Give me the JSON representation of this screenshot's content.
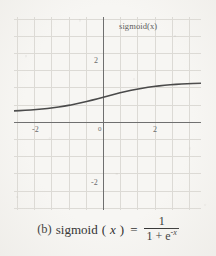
{
  "figure": {
    "axis_label": "sigmoid(x)",
    "caption": {
      "index": "(b)",
      "function_name": "sigmoid",
      "arg_open": "(",
      "variable": "x",
      "arg_close": ")",
      "equals": "=",
      "numerator": "1",
      "denominator_prefix": "1 + e",
      "denominator_exponent": "-x"
    }
  },
  "chart_data": {
    "type": "line",
    "title": "",
    "subtitle": "",
    "xlabel": "",
    "ylabel": "sigmoid(x)",
    "legend": [],
    "legend_position": "none",
    "grid": true,
    "grid_spacing": 1,
    "xlim": [
      -3.2,
      3.5
    ],
    "ylim": [
      -3.3,
      3.2
    ],
    "xticks": [
      -2,
      2
    ],
    "xtick_labels": [
      "-2",
      "2"
    ],
    "yticks": [
      2,
      -2
    ],
    "ytick_labels": [
      "2",
      "-2"
    ],
    "origin_label": "0",
    "axis_color": "#6a6a6a",
    "grid_color": "#d9d7d2",
    "curve_color": "#4a4a4a",
    "background_color": "#f7f6f3",
    "asymptotes": [
      0,
      1
    ],
    "series": [
      {
        "name": "sigmoid(x)",
        "formula": "1/(1+e^-x)",
        "x": [
          -3.2,
          -3.0,
          -2.8,
          -2.6,
          -2.4,
          -2.2,
          -2.0,
          -1.8,
          -1.6,
          -1.4,
          -1.2,
          -1.0,
          -0.8,
          -0.6,
          -0.4,
          -0.2,
          0.0,
          0.2,
          0.4,
          0.6,
          0.8,
          1.0,
          1.2,
          1.4,
          1.6,
          1.8,
          2.0,
          2.2,
          2.4,
          2.6,
          2.8,
          3.0,
          3.2,
          3.5
        ],
        "y": [
          0.039,
          0.047,
          0.057,
          0.069,
          0.083,
          0.1,
          0.119,
          0.142,
          0.168,
          0.198,
          0.231,
          0.269,
          0.31,
          0.354,
          0.401,
          0.45,
          0.5,
          0.55,
          0.599,
          0.646,
          0.69,
          0.731,
          0.769,
          0.802,
          0.832,
          0.858,
          0.881,
          0.9,
          0.917,
          0.931,
          0.943,
          0.953,
          0.961,
          0.971
        ]
      }
    ]
  },
  "ticks_px": {
    "x_neg2": {
      "label": "-2",
      "left": 32,
      "top": 126
    },
    "x_pos2": {
      "label": "2",
      "left": 153,
      "top": 126
    },
    "y_pos2": {
      "label": "2",
      "left": 94,
      "top": 57
    },
    "y_neg2": {
      "label": "-2",
      "left": 91,
      "top": 179
    },
    "origin": {
      "label": "0",
      "left": 97,
      "top": 126
    }
  }
}
